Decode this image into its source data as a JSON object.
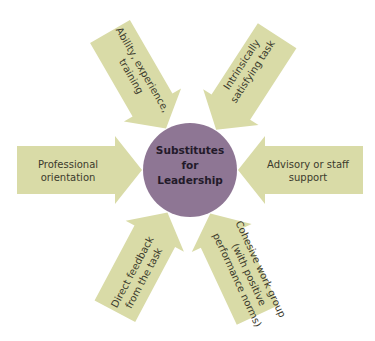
{
  "center": {
    "title": "Substitutes for Leadership",
    "lines": [
      "Substitutes",
      "for",
      "Leadership"
    ]
  },
  "arrows": [
    {
      "id": "ability",
      "lines": [
        "Ability, experience,",
        "training"
      ],
      "direction": "upper-left"
    },
    {
      "id": "intrinsic",
      "lines": [
        "Intrinsically",
        "satisfying task"
      ],
      "direction": "upper-right"
    },
    {
      "id": "professional",
      "lines": [
        "Professional",
        "orientation"
      ],
      "direction": "left"
    },
    {
      "id": "advisory",
      "lines": [
        "Advisory or staff",
        "support"
      ],
      "direction": "right"
    },
    {
      "id": "feedback",
      "lines": [
        "Direct feedback",
        "from the task"
      ],
      "direction": "lower-left"
    },
    {
      "id": "cohesive",
      "lines": [
        "Cohesive work group",
        "(with positive",
        "performance norms)"
      ],
      "direction": "lower-right"
    }
  ],
  "colors": {
    "arrow": "#d9dba7",
    "circle": "#8e7694",
    "text": "#3b3a2c"
  }
}
